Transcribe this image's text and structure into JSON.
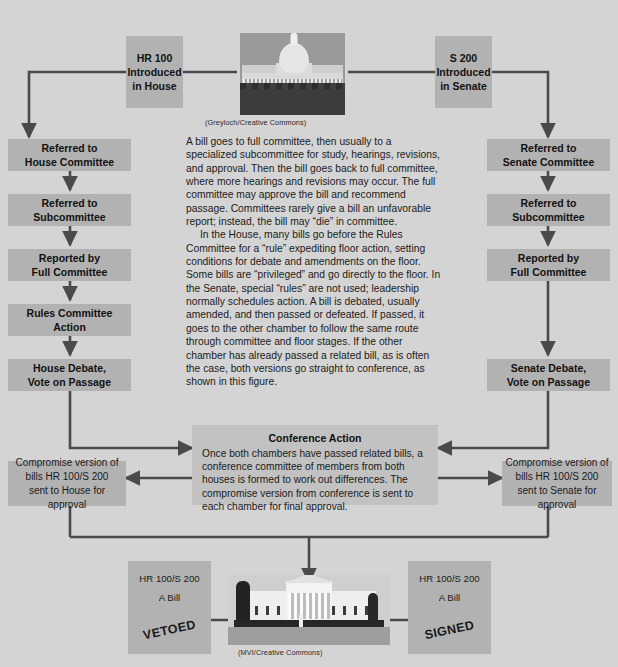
{
  "diagram": {
    "colors": {
      "background": "#d4d4d4",
      "node": "#b2b2b2",
      "conference": "#c2c2c2",
      "arrow": "#4a4a4a",
      "text": "#111111"
    }
  },
  "house_track": {
    "intro": {
      "line1": "HR 100",
      "line2": "Introduced",
      "line3": "in House"
    },
    "steps": [
      {
        "line1": "Referred to",
        "line2": "House Committee"
      },
      {
        "line1": "Referred to",
        "line2": "Subcommittee"
      },
      {
        "line1": "Reported by",
        "line2": "Full Committee"
      },
      {
        "line1": "Rules Committee",
        "line2": "Action"
      },
      {
        "line1": "House Debate,",
        "line2": "Vote on Passage"
      }
    ],
    "compromise": {
      "line1": "Compromise version of",
      "line2": "bills HR 100/S 200",
      "line3": "sent to House for approval"
    }
  },
  "senate_track": {
    "intro": {
      "line1": "S 200",
      "line2": "Introduced",
      "line3": "in Senate"
    },
    "steps": [
      {
        "line1": "Referred to",
        "line2": "Senate Committee"
      },
      {
        "line1": "Referred to",
        "line2": "Subcommittee"
      },
      {
        "line1": "Reported by",
        "line2": "Full Committee"
      },
      {
        "line1": "Senate Debate,",
        "line2": "Vote on Passage"
      }
    ],
    "compromise": {
      "line1": "Compromise version of",
      "line2": "bills HR 100/S 200",
      "line3": "sent to Senate for approval"
    }
  },
  "conference": {
    "title": "Conference Action",
    "body": "Once both chambers have passed related bills, a conference committee of members from both houses is formed to work out differences. The compromise version from conference is sent to each chamber for final approval."
  },
  "prose": {
    "paragraph1": "A bill goes to full committee, then usually to a specialized subcommittee for study, hearings, revisions, and approval. Then the bill goes back to full committee, where more hearings and revisions may occur. The full committee may approve the bill and recommend passage. Committees rarely give a bill an unfavorable report; instead, the bill may “die” in committee.",
    "paragraph2": "In the House, many bills go before the Rules Committee for a “rule” expediting floor action, setting conditions for debate and amendments on the floor. Some bills are “privileged” and go directly to the floor. In the Senate, special “rules” are not used; leadership normally schedules action. A bill is debated, usually amended, and then passed or defeated. If passed, it goes to the other chamber to follow the same route through committee and floor stages. If the other chamber has already passed a related bill, as is often the case, both versions go straight to conference, as shown in this figure."
  },
  "photos": {
    "capitol": {
      "alt": "United States Capitol building",
      "credit": "(Greyloch/Creative Commons)"
    },
    "whitehouse": {
      "alt": "The White House",
      "credit": "(MVI/Creative Commons)"
    }
  },
  "outcomes": {
    "vetoed": {
      "line1": "HR 100/S 200",
      "line2": "A Bill",
      "stamp": "VETOED"
    },
    "signed": {
      "line1": "HR 100/S 200",
      "line2": "A Bill",
      "stamp": "SIGNED"
    }
  }
}
